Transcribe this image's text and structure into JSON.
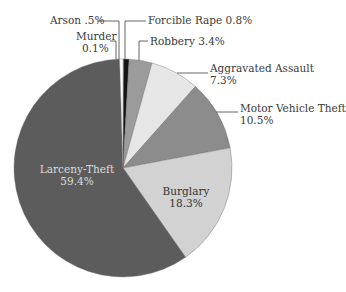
{
  "chart_data": {
    "type": "pie",
    "title": "",
    "start_angle_deg": 0,
    "direction": "clockwise",
    "slices": [
      {
        "name": "Murder",
        "value": 0.1,
        "label": "Murder",
        "value_label": "0.1%",
        "color": "#f4f4f4"
      },
      {
        "name": "Forcible Rape",
        "value": 0.8,
        "label": "Forcible Rape 0.8%",
        "value_label": "",
        "color": "#141414"
      },
      {
        "name": "Robbery",
        "value": 3.4,
        "label": "Robbery 3.4%",
        "value_label": "",
        "color": "#9b9b9b"
      },
      {
        "name": "Aggravated Assault",
        "value": 7.3,
        "label": "Aggravated Assault",
        "value_label": "7.3%",
        "color": "#e6e6e6"
      },
      {
        "name": "Motor Vehicle Theft",
        "value": 10.5,
        "label": "Motor Vehicle Theft",
        "value_label": "10.5%",
        "color": "#8c8c8c"
      },
      {
        "name": "Burglary",
        "value": 18.3,
        "label": "Burglary",
        "value_label": "18.3%",
        "color": "#d2d2d2"
      },
      {
        "name": "Larceny-Theft",
        "value": 59.4,
        "label": "Larceny-Theft",
        "value_label": "59.4%",
        "color": "#5c5c5c"
      },
      {
        "name": "Arson",
        "value": 0.5,
        "label": "Arson .5%",
        "value_label": "",
        "color": "#ffffff"
      }
    ]
  },
  "labels": {
    "arson": "Arson .5%",
    "murder_name": "Murder",
    "murder_value": "0.1%",
    "forcible_rape": "Forcible Rape 0.8%",
    "robbery": "Robbery 3.4%",
    "aggravated_assault_name": "Aggravated Assault",
    "aggravated_assault_value": "7.3%",
    "motor_vehicle_theft_name": "Motor Vehicle Theft",
    "motor_vehicle_theft_value": "10.5%",
    "burglary_name": "Burglary",
    "burglary_value": "18.3%",
    "larceny_theft_name": "Larceny-Theft",
    "larceny_theft_value": "59.4%"
  }
}
